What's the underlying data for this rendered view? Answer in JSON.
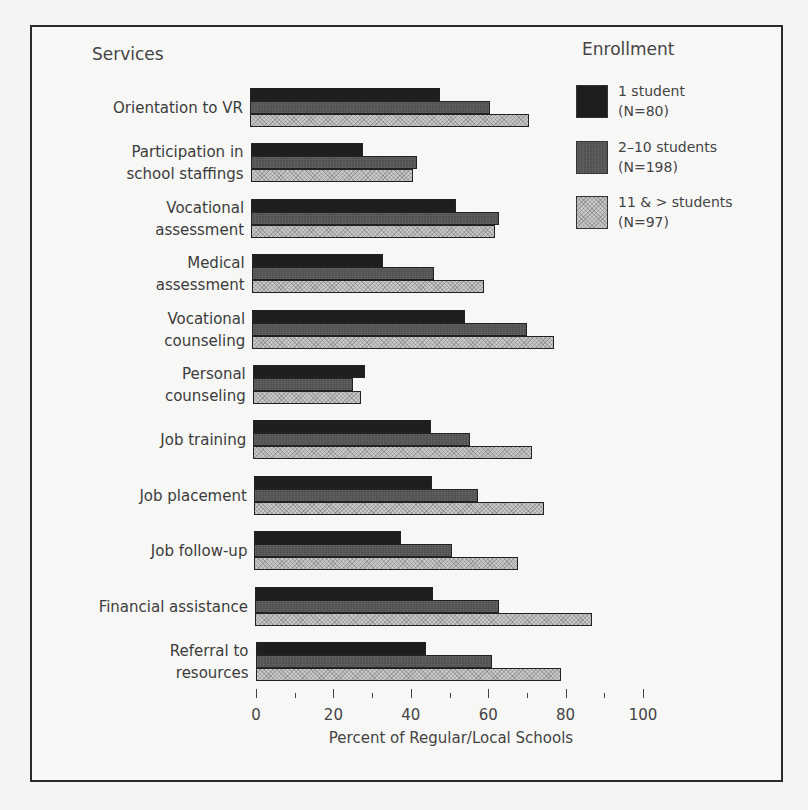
{
  "chart_data": {
    "type": "bar",
    "orientation": "horizontal",
    "title": "",
    "ylabel": "Services",
    "xlabel": "Percent of Regular/Local Schools",
    "xlim": [
      0,
      100
    ],
    "x_ticks": [
      0,
      20,
      40,
      60,
      80,
      100
    ],
    "grid": false,
    "legend_title": "Enrollment",
    "legend_position": "top-right",
    "categories": [
      "Orientation to VR",
      "Participation in school staffings",
      "Vocational assessment",
      "Medical assessment",
      "Vocational counseling",
      "Personal counseling",
      "Job training",
      "Job placement",
      "Job follow-up",
      "Financial assistance",
      "Referral to resources"
    ],
    "series": [
      {
        "name": "1 student (N=80)",
        "values": [
          49,
          29,
          53,
          34,
          55,
          29,
          46,
          46,
          38,
          46,
          44
        ]
      },
      {
        "name": "2-10 students (N=198)",
        "values": [
          62,
          43,
          64,
          47,
          71,
          26,
          56,
          58,
          51,
          63,
          61
        ]
      },
      {
        "name": "11 & > students (N=97)",
        "values": [
          72,
          42,
          63,
          60,
          78,
          28,
          72,
          75,
          68,
          87,
          79
        ]
      }
    ]
  },
  "labels": {
    "services_title": "Services",
    "legend_title": "Enrollment",
    "x_axis_label": "Percent of Regular/Local Schools",
    "category_display": [
      "Orientation to VR",
      "Participation in\nschool staffings",
      "Vocational\nassessment",
      "Medical\nassessment",
      "Vocational\ncounseling",
      "Personal\ncounseling",
      "Job training",
      "Job placement",
      "Job follow-up",
      "Financial assistance",
      "Referral to\nresources"
    ],
    "legend_items": [
      {
        "label": "1 student\n(N=80)",
        "fill": "#1e1e1e"
      },
      {
        "label": "2–10 students\n(N=198)",
        "fill": "#505050"
      },
      {
        "label": "11 & > students\n(N=97)",
        "fill": "#c8c8c8"
      }
    ],
    "tick_labels": [
      "0",
      "20",
      "40",
      "60",
      "80",
      "100"
    ]
  },
  "colors": {
    "series_1": "#1e1e1e",
    "series_2": "#505050",
    "series_3": "#c8c8c8",
    "frame": "#2a2a2a",
    "background": "#f7f7f5"
  }
}
